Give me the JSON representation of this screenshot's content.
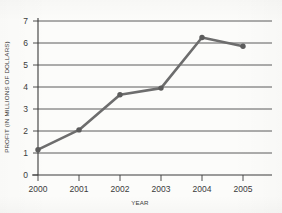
{
  "chart_data": {
    "type": "line",
    "title": "",
    "xlabel": "YEAR",
    "ylabel": "PROFIT (IN MILLIONS OF DOLLARS)",
    "categories": [
      "2000",
      "2001",
      "2002",
      "2003",
      "2004",
      "2005"
    ],
    "x": [
      2000,
      2001,
      2002,
      2003,
      2004,
      2005
    ],
    "values": [
      1.15,
      2.05,
      3.65,
      3.95,
      6.25,
      5.85
    ],
    "series": [
      {
        "name": "Profit",
        "values": [
          1.15,
          2.05,
          3.65,
          3.95,
          6.25,
          5.85
        ]
      }
    ],
    "ylim": [
      0,
      7
    ],
    "ytick_labels": [
      "0",
      "1",
      "2",
      "3",
      "4",
      "5",
      "6",
      "7"
    ],
    "yticks": [
      0,
      1,
      2,
      3,
      4,
      5,
      6,
      7
    ],
    "xtick_labels": [
      "2000",
      "2001",
      "2002",
      "2003",
      "2004",
      "2005"
    ],
    "grid": "horizontal",
    "legend": "none",
    "marker": "circle",
    "line_color": "#6d6d6d",
    "marker_color": "#5c5c5c",
    "grid_color": "#4a4a4a",
    "axis_color": "#3a3a3a",
    "background_color": "#fcfcfa"
  },
  "axes": {
    "y_title": "PROFIT (IN MILLIONS OF DOLLARS)",
    "x_title": "YEAR",
    "y_ticks": [
      {
        "label": "7"
      },
      {
        "label": "6"
      },
      {
        "label": "5"
      },
      {
        "label": "4"
      },
      {
        "label": "3"
      },
      {
        "label": "2"
      },
      {
        "label": "1"
      },
      {
        "label": "0"
      }
    ],
    "x_ticks": [
      {
        "label": "2000"
      },
      {
        "label": "2001"
      },
      {
        "label": "2002"
      },
      {
        "label": "2003"
      },
      {
        "label": "2004"
      },
      {
        "label": "2005"
      }
    ]
  }
}
